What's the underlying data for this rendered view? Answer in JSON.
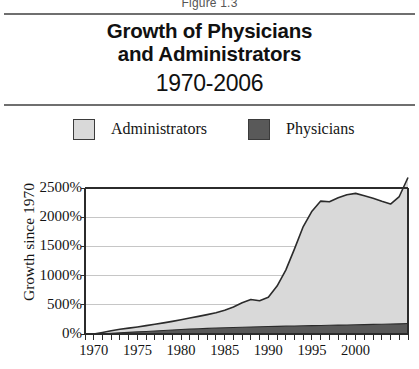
{
  "figure": {
    "caption": "Figure 1.3",
    "title_line_1": "Growth of Physicians",
    "title_line_2": "and Administrators",
    "subtitle": "1970-2006"
  },
  "legend": {
    "position": "top",
    "items": [
      {
        "label": "Administrators",
        "swatch_name": "legend-swatch-administrators",
        "color": "#d9d9d9"
      },
      {
        "label": "Physicians",
        "swatch_name": "legend-swatch-physicians",
        "color": "#595959"
      }
    ]
  },
  "colors": {
    "administrators_fill": "#d9d9d9",
    "physicians_fill": "#595959",
    "line": "#2b2b2b",
    "axis": "#2b2b2b",
    "gridline": "#c6c6c6",
    "rule": "#6f6f6f",
    "background": "#ffffff"
  },
  "chart_data": {
    "type": "area",
    "stacked": true,
    "subtitle": "1970-2006",
    "xlabel": "",
    "ylabel": "Growth since 1970",
    "xlim": [
      1969,
      2006
    ],
    "ylim": [
      0,
      2500
    ],
    "ytick_step": 500,
    "grid": true,
    "grid_axis": "y",
    "legend_position": "top",
    "ytick_labels": [
      "0%",
      "500%",
      "1000%",
      "1500%",
      "2000%",
      "2500%"
    ],
    "ytick_values": [
      0,
      500,
      1000,
      1500,
      2000,
      2500
    ],
    "xtick_labels": [
      "1970",
      "1975",
      "1980",
      "1985",
      "1990",
      "1995",
      "2000"
    ],
    "xtick_values": [
      1970,
      1975,
      1980,
      1985,
      1990,
      1995,
      2000
    ],
    "minor_xtick_interval": 1,
    "x": [
      1970,
      1971,
      1972,
      1973,
      1974,
      1975,
      1976,
      1977,
      1978,
      1979,
      1980,
      1981,
      1982,
      1983,
      1984,
      1985,
      1986,
      1987,
      1988,
      1989,
      1990,
      1991,
      1992,
      1993,
      1994,
      1995,
      1996,
      1997,
      1998,
      1999,
      2000,
      2001,
      2002,
      2003,
      2004,
      2005,
      2006
    ],
    "series": [
      {
        "name": "Physicians",
        "color": "#595959",
        "values": [
          0,
          5,
          12,
          20,
          28,
          36,
          44,
          52,
          60,
          68,
          76,
          83,
          90,
          96,
          102,
          108,
          112,
          116,
          120,
          124,
          128,
          131,
          134,
          137,
          140,
          143,
          146,
          149,
          152,
          155,
          158,
          161,
          164,
          167,
          170,
          174,
          180
        ]
      },
      {
        "name": "Administrators",
        "color": "#d9d9d9",
        "values": [
          0,
          22,
          45,
          60,
          72,
          85,
          100,
          115,
          130,
          148,
          168,
          190,
          212,
          236,
          262,
          300,
          350,
          420,
          470,
          445,
          500,
          690,
          960,
          1320,
          1700,
          1960,
          2130,
          2115,
          2180,
          2230,
          2250,
          2205,
          2160,
          2105,
          2055,
          2180,
          2500
        ]
      }
    ]
  }
}
